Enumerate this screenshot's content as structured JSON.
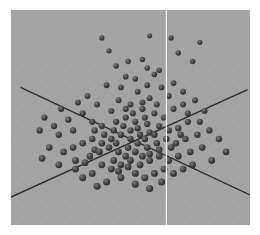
{
  "chart_data": {
    "type": "scatter",
    "title": "",
    "xlabel": "",
    "ylabel": "",
    "zlabel": "",
    "view": "3d-perspective",
    "xlim": [
      0,
      100
    ],
    "ylim": [
      0,
      100
    ],
    "grid": true,
    "legend": "none",
    "colors": {
      "background": "#a4a4a4",
      "grid": "#9a9a9a",
      "axis": "#2a2a2a",
      "vertical_line": "#f2f2f2",
      "point": "#3c3c3c",
      "point_highlight": "#7a7a7a"
    },
    "axes": [
      {
        "name": "axis-a",
        "from": [
          4,
          36
        ],
        "to": [
          100,
          86
        ]
      },
      {
        "name": "axis-b",
        "from": [
          0,
          87
        ],
        "to": [
          99,
          37
        ]
      }
    ],
    "vertical_line_x": 65,
    "points": [
      {
        "x": 38,
        "y": 13
      },
      {
        "x": 58,
        "y": 12
      },
      {
        "x": 67,
        "y": 13
      },
      {
        "x": 79,
        "y": 15
      },
      {
        "x": 41,
        "y": 19
      },
      {
        "x": 44,
        "y": 26
      },
      {
        "x": 55,
        "y": 23
      },
      {
        "x": 49,
        "y": 24
      },
      {
        "x": 57,
        "y": 27
      },
      {
        "x": 62,
        "y": 28
      },
      {
        "x": 52,
        "y": 32
      },
      {
        "x": 60,
        "y": 30
      },
      {
        "x": 48,
        "y": 31
      },
      {
        "x": 70,
        "y": 20
      },
      {
        "x": 76,
        "y": 24
      },
      {
        "x": 63,
        "y": 36
      },
      {
        "x": 57,
        "y": 35
      },
      {
        "x": 68,
        "y": 34
      },
      {
        "x": 46,
        "y": 36
      },
      {
        "x": 40,
        "y": 35
      },
      {
        "x": 53,
        "y": 38
      },
      {
        "x": 58,
        "y": 41
      },
      {
        "x": 66,
        "y": 40
      },
      {
        "x": 72,
        "y": 38
      },
      {
        "x": 61,
        "y": 44
      },
      {
        "x": 55,
        "y": 46
      },
      {
        "x": 50,
        "y": 44
      },
      {
        "x": 45,
        "y": 42
      },
      {
        "x": 42,
        "y": 47
      },
      {
        "x": 36,
        "y": 44
      },
      {
        "x": 32,
        "y": 40
      },
      {
        "x": 28,
        "y": 43
      },
      {
        "x": 30,
        "y": 48
      },
      {
        "x": 24,
        "y": 51
      },
      {
        "x": 21,
        "y": 46
      },
      {
        "x": 18,
        "y": 54
      },
      {
        "x": 14,
        "y": 50
      },
      {
        "x": 12,
        "y": 56
      },
      {
        "x": 20,
        "y": 58
      },
      {
        "x": 26,
        "y": 56
      },
      {
        "x": 34,
        "y": 52
      },
      {
        "x": 38,
        "y": 54
      },
      {
        "x": 44,
        "y": 52
      },
      {
        "x": 48,
        "y": 50
      },
      {
        "x": 52,
        "y": 52
      },
      {
        "x": 56,
        "y": 50
      },
      {
        "x": 60,
        "y": 48
      },
      {
        "x": 64,
        "y": 50
      },
      {
        "x": 68,
        "y": 46
      },
      {
        "x": 72,
        "y": 44
      },
      {
        "x": 77,
        "y": 42
      },
      {
        "x": 81,
        "y": 47
      },
      {
        "x": 74,
        "y": 52
      },
      {
        "x": 70,
        "y": 55
      },
      {
        "x": 66,
        "y": 56
      },
      {
        "x": 62,
        "y": 54
      },
      {
        "x": 58,
        "y": 57
      },
      {
        "x": 54,
        "y": 58
      },
      {
        "x": 50,
        "y": 60
      },
      {
        "x": 46,
        "y": 58
      },
      {
        "x": 42,
        "y": 60
      },
      {
        "x": 38,
        "y": 62
      },
      {
        "x": 34,
        "y": 60
      },
      {
        "x": 30,
        "y": 62
      },
      {
        "x": 26,
        "y": 64
      },
      {
        "x": 22,
        "y": 66
      },
      {
        "x": 16,
        "y": 64
      },
      {
        "x": 13,
        "y": 69
      },
      {
        "x": 20,
        "y": 72
      },
      {
        "x": 27,
        "y": 70
      },
      {
        "x": 33,
        "y": 68
      },
      {
        "x": 37,
        "y": 66
      },
      {
        "x": 41,
        "y": 64
      },
      {
        "x": 45,
        "y": 66
      },
      {
        "x": 49,
        "y": 64
      },
      {
        "x": 53,
        "y": 62
      },
      {
        "x": 57,
        "y": 64
      },
      {
        "x": 61,
        "y": 62
      },
      {
        "x": 65,
        "y": 60
      },
      {
        "x": 69,
        "y": 62
      },
      {
        "x": 73,
        "y": 60
      },
      {
        "x": 78,
        "y": 58
      },
      {
        "x": 83,
        "y": 56
      },
      {
        "x": 87,
        "y": 60
      },
      {
        "x": 80,
        "y": 64
      },
      {
        "x": 75,
        "y": 66
      },
      {
        "x": 70,
        "y": 68
      },
      {
        "x": 66,
        "y": 70
      },
      {
        "x": 62,
        "y": 68
      },
      {
        "x": 58,
        "y": 70
      },
      {
        "x": 54,
        "y": 72
      },
      {
        "x": 50,
        "y": 70
      },
      {
        "x": 46,
        "y": 72
      },
      {
        "x": 42,
        "y": 74
      },
      {
        "x": 38,
        "y": 72
      },
      {
        "x": 34,
        "y": 76
      },
      {
        "x": 30,
        "y": 78
      },
      {
        "x": 40,
        "y": 80
      },
      {
        "x": 46,
        "y": 78
      },
      {
        "x": 52,
        "y": 76
      },
      {
        "x": 56,
        "y": 78
      },
      {
        "x": 60,
        "y": 76
      },
      {
        "x": 64,
        "y": 74
      },
      {
        "x": 68,
        "y": 76
      },
      {
        "x": 72,
        "y": 74
      },
      {
        "x": 76,
        "y": 72
      },
      {
        "x": 84,
        "y": 70
      },
      {
        "x": 90,
        "y": 66
      },
      {
        "x": 52,
        "y": 66
      },
      {
        "x": 48,
        "y": 68
      },
      {
        "x": 44,
        "y": 62
      },
      {
        "x": 56,
        "y": 60
      },
      {
        "x": 60,
        "y": 58
      },
      {
        "x": 50,
        "y": 56
      },
      {
        "x": 47,
        "y": 54
      },
      {
        "x": 53,
        "y": 55
      },
      {
        "x": 57,
        "y": 53
      },
      {
        "x": 51,
        "y": 48
      },
      {
        "x": 55,
        "y": 43
      },
      {
        "x": 48,
        "y": 46
      },
      {
        "x": 43,
        "y": 56
      },
      {
        "x": 39,
        "y": 58
      },
      {
        "x": 35,
        "y": 56
      },
      {
        "x": 58,
        "y": 67
      },
      {
        "x": 62,
        "y": 65
      },
      {
        "x": 45,
        "y": 75
      },
      {
        "x": 49,
        "y": 73
      },
      {
        "x": 43,
        "y": 70
      },
      {
        "x": 55,
        "y": 68
      },
      {
        "x": 36,
        "y": 82
      },
      {
        "x": 63,
        "y": 80
      },
      {
        "x": 58,
        "y": 83
      },
      {
        "x": 52,
        "y": 81
      },
      {
        "x": 27,
        "y": 74
      },
      {
        "x": 31,
        "y": 71
      },
      {
        "x": 35,
        "y": 65
      },
      {
        "x": 74,
        "y": 48
      },
      {
        "x": 79,
        "y": 52
      },
      {
        "x": 67,
        "y": 64
      },
      {
        "x": 71,
        "y": 58
      }
    ]
  }
}
